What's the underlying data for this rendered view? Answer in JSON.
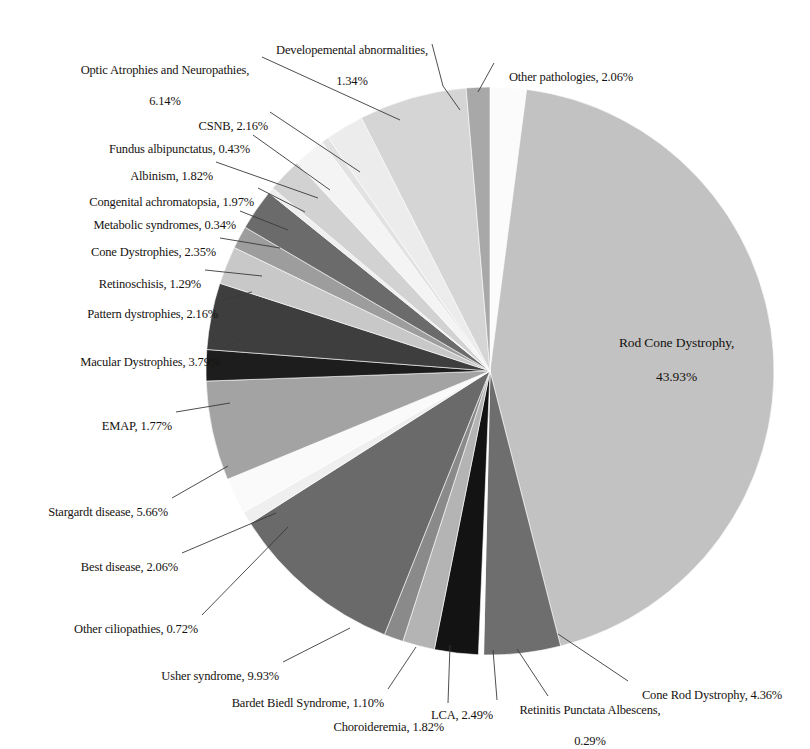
{
  "chart_data": {
    "type": "pie",
    "title": "",
    "subtitle": "",
    "xlabel": "",
    "ylabel": "",
    "legend_position": "none",
    "grid": false,
    "units": "percent",
    "total_percent": 100.0,
    "labels": [
      "Other pathologies",
      "Rod Cone Dystrophy",
      "Cone Rod Dystrophy",
      "Retinitis Punctata Albescens",
      "LCA",
      "Choroideremia",
      "Bardet Biedl Syndrome",
      "Usher syndrome",
      "Other ciliopathies",
      "Best disease",
      "Stargardt disease",
      "EMAP",
      "Macular Dystrophies",
      "Pattern dystrophies",
      "Retinoschisis",
      "Cone Dystrophies",
      "Metabolic syndromes",
      "Congenital achromatopsia",
      "Albinism",
      "Fundus albipunctatus",
      "CSNB",
      "Optic Atrophies and Neuropathies",
      "Developemental abnormalities"
    ],
    "values": [
      2.06,
      43.93,
      4.36,
      0.29,
      2.49,
      1.82,
      1.1,
      9.93,
      0.72,
      2.06,
      5.66,
      1.77,
      3.79,
      2.16,
      1.29,
      2.35,
      0.34,
      1.97,
      1.82,
      0.43,
      2.16,
      6.14,
      1.34
    ],
    "colors": [
      "#fbfbfb",
      "#c2c2c2",
      "#6e6e6e",
      "#ffffff",
      "#131313",
      "#b4b4b4",
      "#8a8a8a",
      "#6a6a6a",
      "#efefef",
      "#fafafa",
      "#a3a3a3",
      "#1d1d1d",
      "#3e3e3e",
      "#c8c8c8",
      "#9d9d9d",
      "#6b6b6b",
      "#efefef",
      "#d2d2d2",
      "#f4f4f4",
      "#e2e2e2",
      "#ececec",
      "#d5d5d5",
      "#a8a8a8"
    ],
    "slices": [
      {
        "label": "Other pathologies",
        "value": 2.06,
        "display": "Other pathologies, 2.06%",
        "color": "#fbfbfb"
      },
      {
        "label": "Rod Cone Dystrophy",
        "value": 43.93,
        "display": "Rod Cone Dystrophy, 43.93%",
        "color": "#c2c2c2"
      },
      {
        "label": "Cone Rod Dystrophy",
        "value": 4.36,
        "display": "Cone Rod Dystrophy, 4.36%",
        "color": "#6e6e6e"
      },
      {
        "label": "Retinitis Punctata Albescens",
        "value": 0.29,
        "display": "Retinitis Punctata Albescens, 0.29%",
        "color": "#ffffff"
      },
      {
        "label": "LCA",
        "value": 2.49,
        "display": "LCA, 2.49%",
        "color": "#131313"
      },
      {
        "label": "Choroideremia",
        "value": 1.82,
        "display": "Choroideremia, 1.82%",
        "color": "#b4b4b4"
      },
      {
        "label": "Bardet Biedl Syndrome",
        "value": 1.1,
        "display": "Bardet Biedl Syndrome, 1.10%",
        "color": "#8a8a8a"
      },
      {
        "label": "Usher syndrome",
        "value": 9.93,
        "display": "Usher syndrome, 9.93%",
        "color": "#6a6a6a"
      },
      {
        "label": "Other ciliopathies",
        "value": 0.72,
        "display": "Other ciliopathies, 0.72%",
        "color": "#efefef"
      },
      {
        "label": "Best disease",
        "value": 2.06,
        "display": "Best disease, 2.06%",
        "color": "#fafafa"
      },
      {
        "label": "Stargardt disease",
        "value": 5.66,
        "display": "Stargardt disease, 5.66%",
        "color": "#a3a3a3"
      },
      {
        "label": "EMAP",
        "value": 1.77,
        "display": "EMAP, 1.77%",
        "color": "#1d1d1d"
      },
      {
        "label": "Macular Dystrophies",
        "value": 3.79,
        "display": "Macular Dystrophies, 3.79%",
        "color": "#3e3e3e"
      },
      {
        "label": "Pattern dystrophies",
        "value": 2.16,
        "display": "Pattern dystrophies, 2.16%",
        "color": "#c8c8c8"
      },
      {
        "label": "Retinoschisis",
        "value": 1.29,
        "display": "Retinoschisis, 1.29%",
        "color": "#9d9d9d"
      },
      {
        "label": "Cone Dystrophies",
        "value": 2.35,
        "display": "Cone Dystrophies, 2.35%",
        "color": "#6b6b6b"
      },
      {
        "label": "Metabolic syndromes",
        "value": 0.34,
        "display": "Metabolic syndromes, 0.34%",
        "color": "#efefef"
      },
      {
        "label": "Congenital achromatopsia",
        "value": 1.97,
        "display": "Congenital achromatopsia, 1.97%",
        "color": "#d2d2d2"
      },
      {
        "label": "Albinism",
        "value": 1.82,
        "display": "Albinism, 1.82%",
        "color": "#f4f4f4"
      },
      {
        "label": "Fundus albipunctatus",
        "value": 0.43,
        "display": "Fundus albipunctatus, 0.43%",
        "color": "#e2e2e2"
      },
      {
        "label": "CSNB",
        "value": 2.16,
        "display": "CSNB, 2.16%",
        "color": "#ececec"
      },
      {
        "label": "Optic Atrophies and Neuropathies",
        "value": 6.14,
        "display": "Optic Atrophies and Neuropathies, 6.14%",
        "color": "#d5d5d5"
      },
      {
        "label": "Developemental abnormalities",
        "value": 1.34,
        "display": "Developemental abnormalities, 1.34%",
        "color": "#a8a8a8"
      }
    ]
  },
  "callouts": {
    "developmental_abnormalities": {
      "line1": "Developemental abnormalities,",
      "line2": "1.34%"
    },
    "other_pathologies": {
      "line1": "Other pathologies, 2.06%"
    },
    "optic_atrophies": {
      "line1": "Optic Atrophies and Neuropathies,",
      "line2": "6.14%"
    },
    "csnb": {
      "line1": "CSNB, 2.16%"
    },
    "fundus_albipunctatus": {
      "line1": "Fundus albipunctatus, 0.43%"
    },
    "albinism": {
      "line1": "Albinism, 1.82%"
    },
    "congenital_achromatopsia": {
      "line1": "Congenital achromatopsia, 1.97%"
    },
    "metabolic_syndromes": {
      "line1": "Metabolic syndromes, 0.34%"
    },
    "cone_dystrophies": {
      "line1": "Cone Dystrophies, 2.35%"
    },
    "retinoschisis": {
      "line1": "Retinoschisis, 1.29%"
    },
    "pattern_dystrophies": {
      "line1": "Pattern dystrophies, 2.16%"
    },
    "macular_dystrophies": {
      "line1": "Macular Dystrophies, 3.79%"
    },
    "emap": {
      "line1": "EMAP, 1.77%"
    },
    "stargardt": {
      "line1": "Stargardt disease, 5.66%"
    },
    "best_disease": {
      "line1": "Best disease, 2.06%"
    },
    "other_ciliopathies": {
      "line1": "Other ciliopathies, 0.72%"
    },
    "usher_syndrome": {
      "line1": "Usher syndrome, 9.93%"
    },
    "bardet_biedl": {
      "line1": "Bardet Biedl Syndrome, 1.10%"
    },
    "choroideremia": {
      "line1": "Choroideremia, 1.82%"
    },
    "lca": {
      "line1": "LCA, 2.49%"
    },
    "retinitis_punctata": {
      "line1": "Retinitis Punctata Albescens,",
      "line2": "0.29%"
    },
    "cone_rod_dystrophy": {
      "line1": "Cone Rod Dystrophy, 4.36%"
    },
    "rod_cone_dystrophy": {
      "line1": "Rod Cone Dystrophy,",
      "line2": "43.93%"
    }
  }
}
